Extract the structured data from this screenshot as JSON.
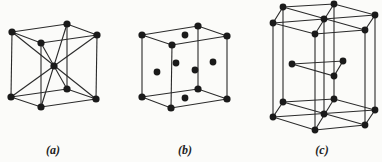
{
  "figure": {
    "colors": {
      "ink": "#1a1a1a",
      "line": "#2a2a2a",
      "background": "#fbfbf9"
    },
    "panels": [
      {
        "id": "a",
        "label": "(a)",
        "structure": "body-centered cubic",
        "label_x": 53
      },
      {
        "id": "b",
        "label": "(b)",
        "structure": "face-centered cubic",
        "label_x": 185
      },
      {
        "id": "c",
        "label": "(c)",
        "structure": "hexagonal close-packed",
        "label_x": 322
      }
    ]
  }
}
